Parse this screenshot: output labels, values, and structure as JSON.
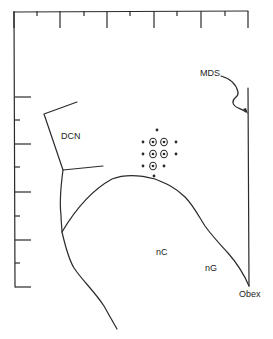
{
  "diagram": {
    "labels": {
      "dcn": "DCN",
      "mds": "MDS",
      "nc": "nC",
      "ng": "nG",
      "obex": "Obex"
    },
    "colors": {
      "ink": "#2a2a2a",
      "background": "#ffffff"
    },
    "frame": {
      "top_major_ticks_x": [
        14,
        60,
        107,
        154,
        201,
        248
      ],
      "top_minor_ticks_x": [
        37,
        84,
        130,
        177,
        225
      ],
      "left_major_ticks_y": [
        97,
        144,
        192,
        240,
        287
      ],
      "left_minor_ticks_y": [
        120,
        167,
        216,
        263
      ]
    },
    "recording_sites": {
      "plain_dots": [
        [
          157,
          130
        ],
        [
          143,
          142
        ],
        [
          176,
          142
        ],
        [
          143,
          154
        ],
        [
          176,
          154
        ],
        [
          143,
          166
        ],
        [
          164,
          166
        ],
        [
          154,
          176
        ]
      ],
      "circled_dots": [
        [
          153,
          142
        ],
        [
          164,
          142
        ],
        [
          153,
          154
        ],
        [
          164,
          154
        ],
        [
          153,
          166
        ]
      ]
    }
  }
}
